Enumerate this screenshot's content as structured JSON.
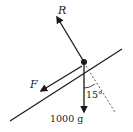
{
  "diagram": {
    "type": "force-diagram",
    "forces": {
      "reaction": {
        "label": "R"
      },
      "friction": {
        "label": "F"
      },
      "weight": {
        "label": "1000 g"
      }
    },
    "angle": {
      "label": "15°",
      "value_deg": 15
    },
    "colors": {
      "line": "#1a1a1a",
      "dashed": "#555555",
      "background": "#ffffff"
    }
  }
}
